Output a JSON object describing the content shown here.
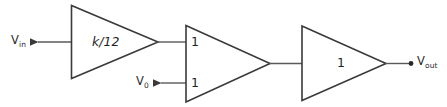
{
  "diagram": {
    "canvas": {
      "width": 447,
      "height": 107,
      "background": "#ffffff"
    },
    "colors": {
      "stroke": "#3a3a3a",
      "wire": "#5a5a5a",
      "text": "#2b2b2b",
      "node": "#2a2a2a"
    },
    "terminals": {
      "input": {
        "label_main": "V",
        "label_sub": "in"
      },
      "offset": {
        "label_main": "V",
        "label_sub": "0"
      },
      "output": {
        "label_main": "V",
        "label_sub": "out"
      }
    },
    "blocks": [
      {
        "id": "amp-gain",
        "gain_label": "k/12",
        "style": "italic"
      },
      {
        "id": "amp-summing",
        "gain_label_top": "1",
        "gain_label_bottom": "1"
      },
      {
        "id": "amp-unity",
        "gain_label": "1"
      }
    ]
  }
}
